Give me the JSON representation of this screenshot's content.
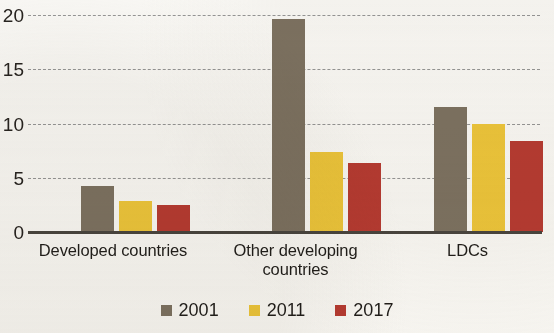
{
  "chart_data": {
    "type": "bar",
    "title": "",
    "subtitle": "",
    "xlabel": "",
    "ylabel": "",
    "ylim": [
      0,
      20
    ],
    "yticks": [
      0,
      5,
      10,
      15,
      20
    ],
    "ytick_labels": [
      "0",
      "5",
      "10",
      "15",
      "20"
    ],
    "grid": true,
    "grid_style": "dashed-horizontal",
    "legend_position": "bottom-center",
    "categories": [
      "Developed countries",
      "Other developing countries",
      "LDCs"
    ],
    "category_lines": [
      [
        "Developed countries"
      ],
      [
        "Other developing",
        "countries"
      ],
      [
        "LDCs"
      ]
    ],
    "series": [
      {
        "name": "2001",
        "color": "#7e7362",
        "values": [
          4.2,
          19.6,
          11.5
        ]
      },
      {
        "name": "2011",
        "color": "#efc73b",
        "values": [
          2.9,
          7.4,
          10.0
        ]
      },
      {
        "name": "2017",
        "color": "#b83c32",
        "values": [
          2.5,
          6.4,
          8.4
        ]
      }
    ]
  },
  "legend": {
    "items": [
      {
        "label": "2001",
        "color": "#7e7362"
      },
      {
        "label": "2011",
        "color": "#efc73b"
      },
      {
        "label": "2017",
        "color": "#b83c32"
      }
    ]
  },
  "colors": {
    "background": "#fbfaf7",
    "axis": "#4a463f",
    "gridline": "#8d8d8d",
    "text": "#211e1a",
    "series_2001": "#7e7362",
    "series_2011": "#efc73b",
    "series_2017": "#b83c32"
  }
}
